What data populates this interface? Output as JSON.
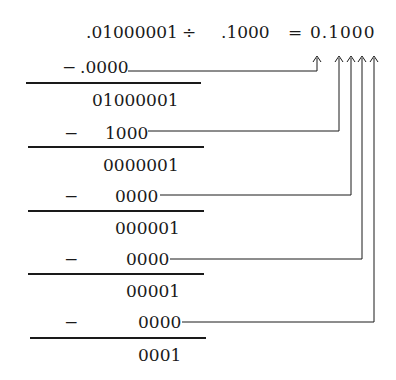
{
  "equation": {
    "dividend": ".01000001",
    "operator": "÷",
    "divisor": ".1000",
    "equals": "=",
    "quotient": "0.1000"
  },
  "steps": [
    {
      "minus": "−",
      "subtrahend": ".0000",
      "remainder": "01000001"
    },
    {
      "minus": "−",
      "subtrahend": "1000",
      "remainder": "0000001"
    },
    {
      "minus": "−",
      "subtrahend": "0000",
      "remainder": "000001"
    },
    {
      "minus": "−",
      "subtrahend": "0000",
      "remainder": "00001"
    },
    {
      "minus": "−",
      "subtrahend": "0000",
      "remainder": "0001"
    }
  ],
  "colors": {
    "ink": "#1a1a1a",
    "background": "#ffffff"
  }
}
